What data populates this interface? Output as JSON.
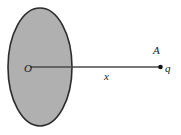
{
  "figure": {
    "caption": "Charged disk of center O with point charge q at point A on the axis at distance x",
    "width": 181,
    "height": 135,
    "background_color": "#ffffff"
  },
  "disk": {
    "name": "charged-disk",
    "fill_color": "#b0b0b0",
    "stroke_color": "#2b2b2b",
    "center_x": 40,
    "center_y": 67,
    "radius_x": 32,
    "radius_y": 59,
    "center_label": "O"
  },
  "axis": {
    "name": "axis-line",
    "stroke_color": "#4a4a4a",
    "x1": 30,
    "y1": 67,
    "x2": 160,
    "y2": 67,
    "distance_label": "x"
  },
  "point_charge": {
    "name": "point-charge",
    "dot_color": "#111111",
    "x": 160,
    "y": 67,
    "point_label": "A",
    "charge_label": "q"
  },
  "labels": {
    "center": "O",
    "distance": "x",
    "point": "A",
    "charge": "q"
  }
}
